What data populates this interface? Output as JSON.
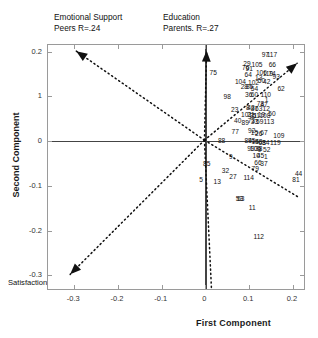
{
  "chart_data": {
    "type": "scatter",
    "title": "",
    "xlabel": "First Component",
    "ylabel": "Second Component",
    "xlim": [
      -0.36,
      0.23
    ],
    "ylim": [
      -0.335,
      0.215
    ],
    "grid": false,
    "legend_position": "none",
    "xticks": [
      "-0.3",
      "-0.2",
      "-0.1",
      "0",
      "0.1",
      "0.2"
    ],
    "xtick_values": [
      -0.3,
      -0.2,
      -0.1,
      0,
      0.1,
      0.2
    ],
    "yticks": [
      "0.2",
      "1",
      "0",
      "-0.1",
      "-0.2",
      "-0.3"
    ],
    "ytick_values": [
      0.2,
      0.1,
      0,
      -0.1,
      -0.2,
      -0.3
    ],
    "annotations": [
      {
        "name": "emotional-support-label",
        "text": "Emotional Support\nPeers R=.24",
        "r": 0.24
      },
      {
        "name": "education-parents-label",
        "text": "Education\nParents. R=.27",
        "r": 0.27
      },
      {
        "name": "satisfaction-label",
        "text": "Satisfaction withinformational support R=.31",
        "r": 0.31
      }
    ],
    "vectors": [
      {
        "name": "emotional-support-vector",
        "x0": 0.0,
        "y0": 0.0,
        "x1": -0.293,
        "y1": 0.199,
        "style": "dotted-arrow"
      },
      {
        "name": "education-parents-vector",
        "x0": 0.0,
        "y0": 0.0,
        "x1": 0.005,
        "y1": 0.2,
        "style": "dotted-arrow"
      },
      {
        "name": "informational-support-vector",
        "x0": 0.0,
        "y0": 0.0,
        "x1": 0.212,
        "y1": 0.172,
        "style": "dotted-arrow"
      },
      {
        "name": "satisfaction-vector",
        "x0": 0.0,
        "y0": 0.0,
        "x1": -0.307,
        "y1": -0.3,
        "style": "dotted-arrow"
      },
      {
        "name": "downward-vector",
        "x0": 0.0,
        "y0": 0.0,
        "x1": 0.016,
        "y1": -0.33,
        "style": "dotted"
      },
      {
        "name": "lower-right-vector",
        "x0": 0.0,
        "y0": 0.0,
        "x1": 0.216,
        "y1": -0.128,
        "style": "dotted"
      }
    ],
    "points": [
      {
        "label": "97",
        "x": 0.137,
        "y": 0.192
      },
      {
        "label": "117",
        "x": 0.152,
        "y": 0.192
      },
      {
        "label": "29",
        "x": 0.095,
        "y": 0.173
      },
      {
        "label": "105",
        "x": 0.118,
        "y": 0.171
      },
      {
        "label": "66",
        "x": 0.153,
        "y": 0.17
      },
      {
        "label": "76",
        "x": 0.092,
        "y": 0.163
      },
      {
        "label": "91",
        "x": 0.1,
        "y": 0.161
      },
      {
        "label": "75",
        "x": 0.018,
        "y": 0.152
      },
      {
        "label": "64",
        "x": 0.098,
        "y": 0.148
      },
      {
        "label": "106",
        "x": 0.128,
        "y": 0.152
      },
      {
        "label": "119",
        "x": 0.143,
        "y": 0.15
      },
      {
        "label": "74",
        "x": 0.152,
        "y": 0.15
      },
      {
        "label": "93",
        "x": 0.162,
        "y": 0.143
      },
      {
        "label": "13",
        "x": 0.122,
        "y": 0.142
      },
      {
        "label": "50",
        "x": 0.128,
        "y": 0.134
      },
      {
        "label": "42",
        "x": 0.14,
        "y": 0.133
      },
      {
        "label": "104",
        "x": 0.08,
        "y": 0.132
      },
      {
        "label": "102",
        "x": 0.11,
        "y": 0.13
      },
      {
        "label": "28",
        "x": 0.089,
        "y": 0.12
      },
      {
        "label": "86",
        "x": 0.101,
        "y": 0.12
      },
      {
        "label": "54",
        "x": 0.112,
        "y": 0.117
      },
      {
        "label": "62",
        "x": 0.173,
        "y": 0.116
      },
      {
        "label": "36",
        "x": 0.099,
        "y": 0.103
      },
      {
        "label": "60",
        "x": 0.112,
        "y": 0.103
      },
      {
        "label": "110",
        "x": 0.138,
        "y": 0.103
      },
      {
        "label": "98",
        "x": 0.05,
        "y": 0.098
      },
      {
        "label": "1",
        "x": 0.14,
        "y": 0.093
      },
      {
        "label": "78",
        "x": 0.126,
        "y": 0.082
      },
      {
        "label": "47",
        "x": 0.134,
        "y": 0.081
      },
      {
        "label": "8",
        "x": 0.097,
        "y": 0.074
      },
      {
        "label": "43",
        "x": 0.104,
        "y": 0.075
      },
      {
        "label": "87",
        "x": 0.112,
        "y": 0.073
      },
      {
        "label": "63",
        "x": 0.122,
        "y": 0.073
      },
      {
        "label": "12",
        "x": 0.139,
        "y": 0.071
      },
      {
        "label": "23",
        "x": 0.067,
        "y": 0.07
      },
      {
        "label": "101",
        "x": 0.094,
        "y": 0.058
      },
      {
        "label": "21",
        "x": 0.104,
        "y": 0.058
      },
      {
        "label": "31",
        "x": 0.11,
        "y": 0.057
      },
      {
        "label": "51",
        "x": 0.116,
        "y": 0.057
      },
      {
        "label": "19",
        "x": 0.128,
        "y": 0.058
      },
      {
        "label": "108",
        "x": 0.136,
        "y": 0.057
      },
      {
        "label": "50",
        "x": 0.152,
        "y": 0.06
      },
      {
        "label": "40",
        "x": 0.074,
        "y": 0.045
      },
      {
        "label": "89",
        "x": 0.091,
        "y": 0.041
      },
      {
        "label": "73",
        "x": 0.105,
        "y": 0.044
      },
      {
        "label": "33",
        "x": 0.112,
        "y": 0.043
      },
      {
        "label": "59",
        "x": 0.124,
        "y": 0.043
      },
      {
        "label": "113",
        "x": 0.145,
        "y": 0.042
      },
      {
        "label": "77",
        "x": 0.068,
        "y": 0.021
      },
      {
        "label": "92",
        "x": 0.106,
        "y": 0.022
      },
      {
        "label": "15",
        "x": 0.112,
        "y": 0.018
      },
      {
        "label": "26",
        "x": 0.122,
        "y": 0.017
      },
      {
        "label": "67",
        "x": 0.134,
        "y": 0.019
      },
      {
        "label": "109",
        "x": 0.168,
        "y": 0.012
      },
      {
        "label": "88",
        "x": 0.037,
        "y": 0.0
      },
      {
        "label": "84",
        "x": 0.098,
        "y": 0.001
      },
      {
        "label": "95",
        "x": 0.106,
        "y": 0.0
      },
      {
        "label": "14",
        "x": 0.114,
        "y": -0.002
      },
      {
        "label": "58",
        "x": 0.122,
        "y": -0.002
      },
      {
        "label": "68",
        "x": 0.13,
        "y": -0.003
      },
      {
        "label": "34",
        "x": 0.138,
        "y": -0.003
      },
      {
        "label": "119",
        "x": 0.16,
        "y": -0.004
      },
      {
        "label": "99",
        "x": 0.104,
        "y": -0.018
      },
      {
        "label": "100",
        "x": 0.114,
        "y": -0.017
      },
      {
        "label": "38",
        "x": 0.122,
        "y": -0.018
      },
      {
        "label": "9",
        "x": 0.124,
        "y": -0.019
      },
      {
        "label": "52",
        "x": 0.14,
        "y": -0.02
      },
      {
        "label": "9",
        "x": 0.058,
        "y": -0.036
      },
      {
        "label": "10",
        "x": 0.116,
        "y": -0.034
      },
      {
        "label": "45",
        "x": 0.126,
        "y": -0.034
      },
      {
        "label": "1",
        "x": 0.138,
        "y": -0.035
      },
      {
        "label": "85",
        "x": 0.003,
        "y": -0.05
      },
      {
        "label": "66",
        "x": 0.12,
        "y": -0.049
      },
      {
        "label": "37",
        "x": 0.134,
        "y": -0.05
      },
      {
        "label": "32",
        "x": 0.046,
        "y": -0.067
      },
      {
        "label": "79",
        "x": 0.114,
        "y": -0.063
      },
      {
        "label": "44",
        "x": 0.213,
        "y": -0.073
      },
      {
        "label": "5",
        "x": -0.01,
        "y": -0.086
      },
      {
        "label": "27",
        "x": 0.063,
        "y": -0.08
      },
      {
        "label": "114",
        "x": 0.099,
        "y": -0.082
      },
      {
        "label": "81",
        "x": 0.207,
        "y": -0.086
      },
      {
        "label": "13",
        "x": 0.027,
        "y": -0.091
      },
      {
        "label": "53",
        "x": 0.078,
        "y": -0.13
      },
      {
        "label": "63",
        "x": 0.081,
        "y": -0.13
      },
      {
        "label": "11",
        "x": 0.107,
        "y": -0.15
      },
      {
        "label": "112",
        "x": 0.122,
        "y": -0.215
      }
    ]
  }
}
